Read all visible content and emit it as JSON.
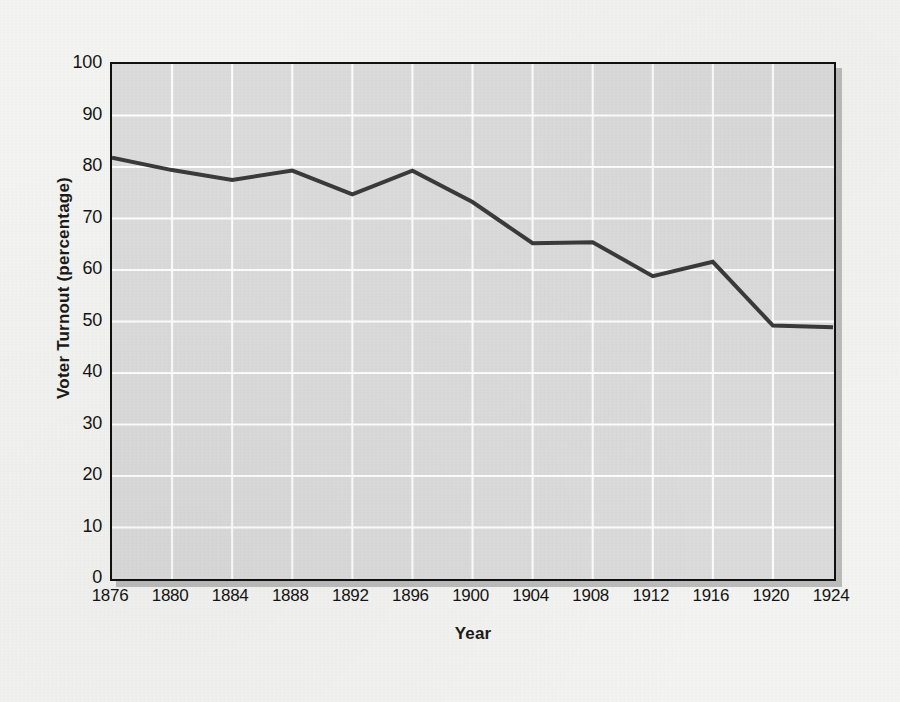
{
  "chart_data": {
    "type": "line",
    "title": "",
    "xlabel": "Year",
    "ylabel": "Voter Turnout (percentage)",
    "categories": [
      "1876",
      "1880",
      "1884",
      "1888",
      "1892",
      "1896",
      "1900",
      "1904",
      "1908",
      "1912",
      "1916",
      "1920",
      "1924"
    ],
    "x": [
      1876,
      1880,
      1884,
      1888,
      1892,
      1896,
      1900,
      1904,
      1908,
      1912,
      1916,
      1920,
      1924
    ],
    "values": [
      81.8,
      79.4,
      77.5,
      79.3,
      74.7,
      79.3,
      73.2,
      65.2,
      65.4,
      58.8,
      61.6,
      49.2,
      48.9
    ],
    "series": [
      {
        "name": "Voter Turnout",
        "values": [
          81.8,
          79.4,
          77.5,
          79.3,
          74.7,
          79.3,
          73.2,
          65.2,
          65.4,
          58.8,
          61.6,
          49.2,
          48.9
        ]
      }
    ],
    "xlim": [
      1876,
      1924
    ],
    "ylim": [
      0,
      100
    ],
    "yticks": [
      0,
      10,
      20,
      30,
      40,
      50,
      60,
      70,
      80,
      90,
      100
    ],
    "ytick_labels": [
      "0",
      "10",
      "20",
      "30",
      "40",
      "50",
      "60",
      "70",
      "80",
      "90",
      "100"
    ],
    "xtick_labels": [
      "1876",
      "1880",
      "1884",
      "1888",
      "1892",
      "1896",
      "1900",
      "1904",
      "1908",
      "1912",
      "1916",
      "1920",
      "1924"
    ],
    "grid": true,
    "grid_color": "#ffffff",
    "legend": false,
    "legend_position": "none",
    "line_color": "#3a3a3a",
    "line_width": 4,
    "plot_background": "#dcdcdc",
    "page_background": "#f4f4f2",
    "axis_color": "#101010",
    "annotations": []
  }
}
